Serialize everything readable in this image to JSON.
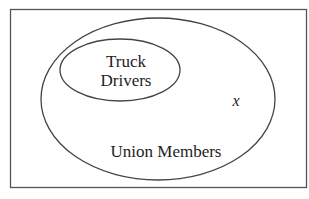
{
  "diagram": {
    "type": "venn",
    "universe": {
      "label": ""
    },
    "sets": [
      {
        "id": "union-members",
        "label": "Union Members"
      },
      {
        "id": "truck-drivers",
        "label_lines": [
          "Truck",
          "Drivers"
        ],
        "subset_of": "union-members"
      }
    ],
    "element": {
      "label": "x",
      "in": "union-members",
      "not_in": "truck-drivers"
    }
  },
  "colors": {
    "stroke": "#444444",
    "text": "#222222",
    "background": "#ffffff"
  }
}
